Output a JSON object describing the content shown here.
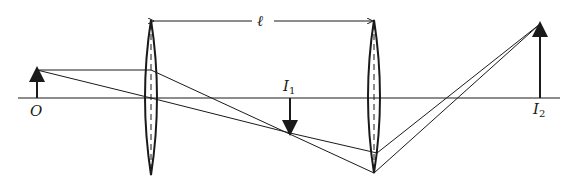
{
  "diagram": {
    "labels": {
      "object": "O",
      "first_image": "I",
      "first_image_sub": "1",
      "second_image": "I",
      "second_image_sub": "2",
      "separation": "ℓ"
    },
    "colors": {
      "ink": "#1a1a1a",
      "background": "#ffffff"
    }
  }
}
